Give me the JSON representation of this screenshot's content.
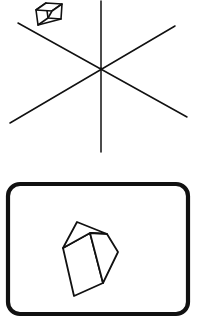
{
  "figure": {
    "title": "",
    "background_color": "#ffffff",
    "ink_color": "#111111",
    "canvas": {
      "width": 197,
      "height": 330
    },
    "panels": [
      {
        "name": "upper-panel",
        "description": "six-ray asterisk with small floating cube"
      },
      {
        "name": "lower-panel",
        "description": "rounded rectangle frame containing a large tilted cube"
      }
    ]
  },
  "upper_panel": {
    "name": "asterisk-panel",
    "center": {
      "x": 101,
      "y": 68
    },
    "rays": [
      {
        "name": "vertical-ray-up",
        "x1": 101,
        "y1": 1,
        "x2": 101,
        "y2": 68
      },
      {
        "name": "vertical-ray-down",
        "x1": 101,
        "y1": 68,
        "x2": 101,
        "y2": 152
      },
      {
        "name": "diagonal-ray-upleft-to-downright",
        "x1": 18,
        "y1": 23,
        "x2": 187,
        "y2": 117
      },
      {
        "name": "diagonal-ray-downleft-to-upright",
        "x1": 10,
        "y1": 123,
        "x2": 175,
        "y2": 26
      }
    ],
    "small_cube": {
      "name": "small-cube",
      "front_face": [
        {
          "x": 36,
          "y": 10
        },
        {
          "x": 46,
          "y": 3
        },
        {
          "x": 48,
          "y": 18
        },
        {
          "x": 38,
          "y": 25
        }
      ],
      "top_face": [
        {
          "x": 36,
          "y": 10
        },
        {
          "x": 46,
          "y": 3
        },
        {
          "x": 62,
          "y": 4
        },
        {
          "x": 52,
          "y": 11
        }
      ],
      "side_face": [
        {
          "x": 48,
          "y": 18
        },
        {
          "x": 52,
          "y": 11
        },
        {
          "x": 62,
          "y": 4
        },
        {
          "x": 61,
          "y": 19
        }
      ],
      "bottom_edge": {
        "x1": 38,
        "y1": 25,
        "x2": 61,
        "y2": 19
      }
    }
  },
  "lower_panel": {
    "name": "framed-cube-panel",
    "frame": {
      "name": "rounded-rectangle-frame",
      "x": 8,
      "y": 184,
      "width": 180,
      "height": 130,
      "radius": 12
    },
    "large_cube": {
      "name": "large-cube",
      "front_face": [
        {
          "x": 63,
          "y": 248
        },
        {
          "x": 90,
          "y": 233
        },
        {
          "x": 103,
          "y": 283
        },
        {
          "x": 74,
          "y": 296
        }
      ],
      "top_face": [
        {
          "x": 63,
          "y": 248
        },
        {
          "x": 77,
          "y": 222
        },
        {
          "x": 107,
          "y": 234
        },
        {
          "x": 90,
          "y": 233
        }
      ],
      "side_face": [
        {
          "x": 90,
          "y": 233
        },
        {
          "x": 107,
          "y": 234
        },
        {
          "x": 118,
          "y": 252
        },
        {
          "x": 103,
          "y": 283
        }
      ]
    }
  }
}
